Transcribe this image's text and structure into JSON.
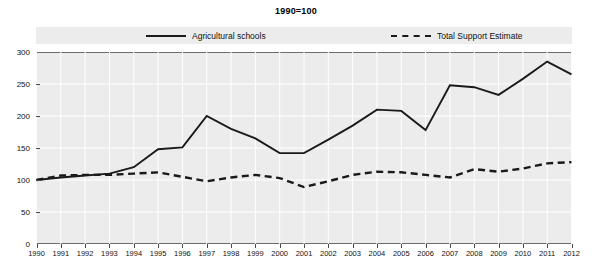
{
  "chart_data": {
    "type": "line",
    "title": "1990=100",
    "xlabel": "",
    "ylabel": "",
    "ylim": [
      0,
      300
    ],
    "yticks": [
      0,
      50,
      100,
      150,
      200,
      250,
      300
    ],
    "grid": true,
    "legend_position": "top",
    "categories": [
      "1990",
      "1991",
      "1992",
      "1993",
      "1994",
      "1995",
      "1996",
      "1997",
      "1998",
      "1999",
      "2000",
      "2001",
      "2002",
      "2003",
      "2004",
      "2005",
      "2006",
      "2007",
      "2008",
      "2009",
      "2010",
      "2011",
      "2012"
    ],
    "series": [
      {
        "name": "Agricultural schools",
        "style": "solid",
        "color": "#1a1a1a",
        "values": [
          100,
          104,
          107,
          110,
          120,
          148,
          151,
          200,
          180,
          165,
          142,
          142,
          163,
          185,
          210,
          208,
          178,
          248,
          245,
          233,
          258,
          285,
          265
        ]
      },
      {
        "name": "Total Support Estimate",
        "style": "dashed",
        "color": "#1a1a1a",
        "values": [
          100,
          107,
          108,
          108,
          110,
          112,
          105,
          98,
          104,
          108,
          103,
          89,
          98,
          108,
          113,
          112,
          108,
          104,
          117,
          113,
          118,
          126,
          128
        ]
      }
    ]
  },
  "legend": {
    "items": [
      {
        "label": "Agricultural schools"
      },
      {
        "label": "Total Support Estimate"
      }
    ]
  },
  "colors": {
    "plot_background": "#ececec",
    "legend_background": "#ececec",
    "line": "#1a1a1a",
    "grid": "#ffffff",
    "axis": "#6d6d6d",
    "text": "#111111"
  }
}
